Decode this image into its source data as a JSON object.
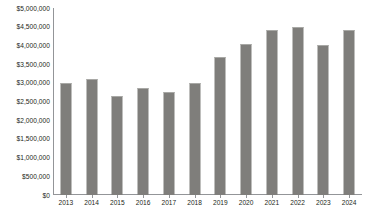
{
  "chart_data": {
    "type": "bar",
    "title": "",
    "xlabel": "",
    "ylabel": "",
    "categories": [
      "2013",
      "2014",
      "2015",
      "2016",
      "2017",
      "2018",
      "2019",
      "2020",
      "2021",
      "2022",
      "2023",
      "2024"
    ],
    "values": [
      3000000,
      3100000,
      2650000,
      2850000,
      2750000,
      3000000,
      3700000,
      4050000,
      4400000,
      4500000,
      4000000,
      4400000
    ],
    "ylim": [
      0,
      5000000
    ],
    "ytick_values": [
      0,
      500000,
      1000000,
      1500000,
      2000000,
      2500000,
      3000000,
      3500000,
      4000000,
      4500000,
      5000000
    ],
    "ytick_labels": [
      "$0",
      "$500,000",
      "$1,000,000",
      "$1,500,000",
      "$2,000,000",
      "$2,500,000",
      "$3,000,000",
      "$3,500,000",
      "$4,000,000",
      "$4,500,000",
      "$5,000,000"
    ],
    "grid": false,
    "legend": false,
    "legend_position": "none",
    "bar_color": "#7f7e7b",
    "axis_color": "#939598",
    "text_color": "#231f20",
    "background_color": "#ffffff"
  }
}
